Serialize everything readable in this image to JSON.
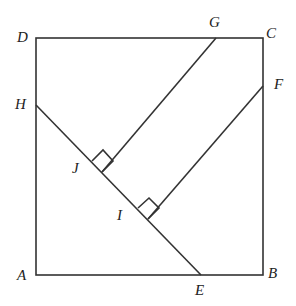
{
  "diagram": {
    "type": "geometry",
    "points": {
      "A": {
        "label": "A",
        "x": 36,
        "y": 275
      },
      "B": {
        "label": "B",
        "x": 263,
        "y": 275
      },
      "C": {
        "label": "C",
        "x": 263,
        "y": 38
      },
      "D": {
        "label": "D",
        "x": 36,
        "y": 38
      },
      "E": {
        "label": "E",
        "x": 201,
        "y": 275
      },
      "F": {
        "label": "F",
        "x": 263,
        "y": 86
      },
      "G": {
        "label": "G",
        "x": 216,
        "y": 38
      },
      "H": {
        "label": "H",
        "x": 36,
        "y": 105
      },
      "I": {
        "label": "I",
        "x": 148,
        "y": 219
      },
      "J": {
        "label": "J",
        "x": 102,
        "y": 172
      }
    },
    "segments": [
      "AB",
      "BC",
      "CD",
      "DA",
      "HE",
      "GJ",
      "FI"
    ],
    "right_angles": [
      "GJ ⊥ HE at J",
      "FI ⊥ HE at I"
    ]
  }
}
